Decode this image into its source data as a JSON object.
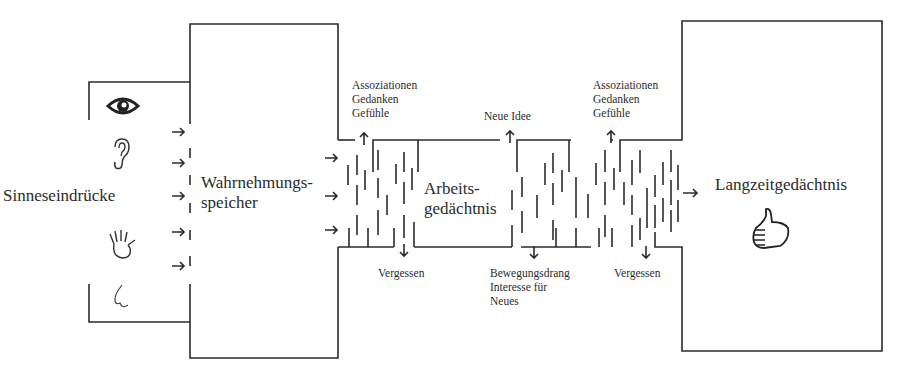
{
  "diagram": {
    "type": "memory-flow",
    "stages": {
      "senses": {
        "label": "Sinneseindrücke",
        "icons": [
          "eye-icon",
          "ear-icon",
          "hand-icon",
          "nose-icon"
        ]
      },
      "sensory_memory": {
        "label_line1": "Wahrnehmungs-",
        "label_line2": "speicher"
      },
      "working_memory": {
        "label_line1": "Arbeits-",
        "label_line2": "gedächtnis"
      },
      "long_term_memory": {
        "label": "Langzeitgedächtnis",
        "icon": "thumbs-up-icon"
      }
    },
    "annotations": {
      "top_left": [
        "Assoziationen",
        "Gedanken",
        "Gefühle"
      ],
      "top_middle": "Neue Idee",
      "top_right": [
        "Assoziationen",
        "Gedanken",
        "Gefühle"
      ],
      "bottom_left": "Vergessen",
      "bottom_middle": [
        "Bewegungsdrang",
        "Interesse für",
        "Neues"
      ],
      "bottom_right": "Vergessen"
    },
    "line_color": "#2b2b2b"
  }
}
